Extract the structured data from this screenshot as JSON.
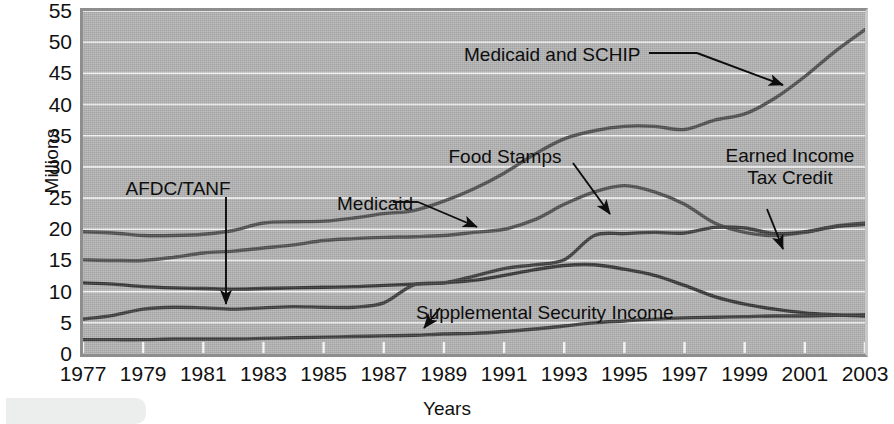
{
  "chart_data": {
    "type": "line",
    "title": "",
    "xlabel": "Years",
    "ylabel": "Millions",
    "xlim": [
      1977,
      2003
    ],
    "ylim": [
      0,
      55
    ],
    "ytick_step": 5,
    "grid": true,
    "legend_position": "inline-annotations",
    "categories": [
      1977,
      1978,
      1979,
      1980,
      1981,
      1982,
      1983,
      1984,
      1985,
      1986,
      1987,
      1988,
      1989,
      1990,
      1991,
      1992,
      1993,
      1994,
      1995,
      1996,
      1997,
      1998,
      1999,
      2000,
      2001,
      2002,
      2003
    ],
    "ytick_labels": [
      "0",
      "5",
      "10",
      "15",
      "20",
      "25",
      "30",
      "35",
      "40",
      "45",
      "50",
      "55"
    ],
    "xtick_labels": [
      "1977",
      "1979",
      "1981",
      "1983",
      "1985",
      "1987",
      "1989",
      "1991",
      "1993",
      "1995",
      "1997",
      "1999",
      "2001",
      "2003"
    ],
    "series": [
      {
        "name": "Medicaid and SCHIP",
        "color": "#4c4c4c",
        "values": [
          19.6,
          19.4,
          19.0,
          19.0,
          19.2,
          19.8,
          21.0,
          21.2,
          21.3,
          21.8,
          22.5,
          23.0,
          24.5,
          26.5,
          29.0,
          32.0,
          34.5,
          35.8,
          36.5,
          36.5,
          36.0,
          37.5,
          38.5,
          41.0,
          44.5,
          48.5,
          52.0
        ]
      },
      {
        "name": "Food Stamps",
        "color": "#4c4c4c",
        "values": [
          15.1,
          15.0,
          15.0,
          15.5,
          16.2,
          16.5,
          17.0,
          17.5,
          18.2,
          18.5,
          18.7,
          18.8,
          19.0,
          19.5,
          20.0,
          21.5,
          24.0,
          26.0,
          27.0,
          26.0,
          24.0,
          21.0,
          19.5,
          19.0,
          19.5,
          20.5,
          21.0
        ]
      },
      {
        "name": "AFDC/TANF",
        "color": "#333333",
        "values": [
          11.4,
          11.2,
          10.8,
          10.6,
          10.5,
          10.4,
          10.5,
          10.6,
          10.7,
          10.8,
          11.0,
          11.2,
          11.4,
          11.8,
          12.6,
          13.5,
          14.2,
          14.3,
          13.6,
          12.6,
          11.0,
          9.2,
          8.0,
          7.2,
          6.6,
          6.3,
          6.1
        ]
      },
      {
        "name": "Earned Income Tax Credit",
        "color": "#3a3a3a",
        "values": [
          5.6,
          6.2,
          7.2,
          7.5,
          7.4,
          7.2,
          7.4,
          7.6,
          7.5,
          7.5,
          8.2,
          11.1,
          11.4,
          12.5,
          13.7,
          14.3,
          15.1,
          19.0,
          19.3,
          19.5,
          19.4,
          20.3,
          20.2,
          19.3,
          19.6,
          20.4,
          20.8
        ]
      },
      {
        "name": "Supplemental Security Income",
        "color": "#3a3a3a",
        "values": [
          2.3,
          2.3,
          2.3,
          2.4,
          2.4,
          2.4,
          2.5,
          2.6,
          2.7,
          2.8,
          2.9,
          3.0,
          3.2,
          3.3,
          3.6,
          4.0,
          4.5,
          5.0,
          5.3,
          5.6,
          5.8,
          5.9,
          6.0,
          6.1,
          6.1,
          6.2,
          6.3
        ]
      }
    ],
    "annotations": [
      {
        "id": "medicaid-schip",
        "text": "Medicaid and SCHIP",
        "x": 640,
        "y": 44,
        "align": "left"
      },
      {
        "id": "food-stamps",
        "text": "Food Stamps",
        "x": 505,
        "y": 146,
        "align": "center"
      },
      {
        "id": "medicaid",
        "text": "Medicaid",
        "x": 375,
        "y": 193,
        "align": "center"
      },
      {
        "id": "afdc-tanf",
        "text": "AFDC/TANF",
        "x": 178,
        "y": 178,
        "align": "center"
      },
      {
        "id": "earned-income-tax-credit",
        "text": "Earned Income\nTax Credit",
        "x": 790,
        "y": 145,
        "align": "center"
      },
      {
        "id": "supplemental-security-income",
        "text": "Supplemental Security Income",
        "x": 545,
        "y": 302,
        "align": "center"
      }
    ]
  }
}
